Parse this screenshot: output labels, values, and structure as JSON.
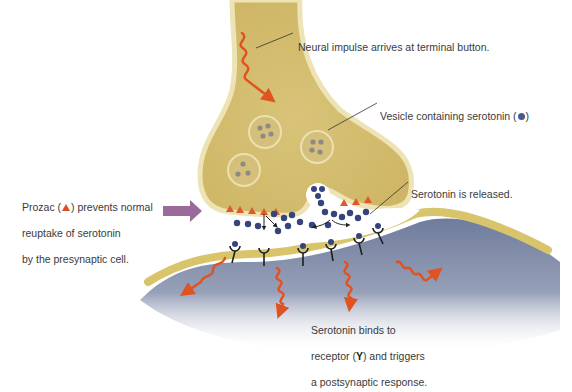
{
  "diagram": {
    "colors": {
      "presynaptic_fill": "#d9c47a",
      "presynaptic_edge": "#ede3b4",
      "postsynaptic_fill": "#7e8aa8",
      "membrane": "#d8c46a",
      "serotonin": "#36447e",
      "prozac": "#de5a2a",
      "impulse": "#e0521f",
      "arrow": "#9a6b9a",
      "text": "#3a3a3a"
    },
    "labels": {
      "impulse": "Neural impulse arrives at terminal button.",
      "vesicle_prefix": "Vesicle containing serotonin (",
      "vesicle_suffix": ")",
      "released": "Serotonin is released.",
      "prozac_prefix": "Prozac (",
      "prozac_line1_suffix": ") prevents normal",
      "prozac_line2": "reuptake of serotonin",
      "prozac_line3": "by the presynaptic cell.",
      "binds_line1": "Serotonin binds to",
      "binds_line2_prefix": "receptor (",
      "receptor_symbol": "Y",
      "binds_line2_suffix": ") and triggers",
      "binds_line3": "a postsynaptic response."
    },
    "structures": {
      "presynaptic_terminal": "Terminal button",
      "vesicle_count": 3,
      "postsynaptic_cell": "Postsynaptic cell",
      "receptor_count": 8,
      "postsynaptic_impulses": 4
    }
  }
}
